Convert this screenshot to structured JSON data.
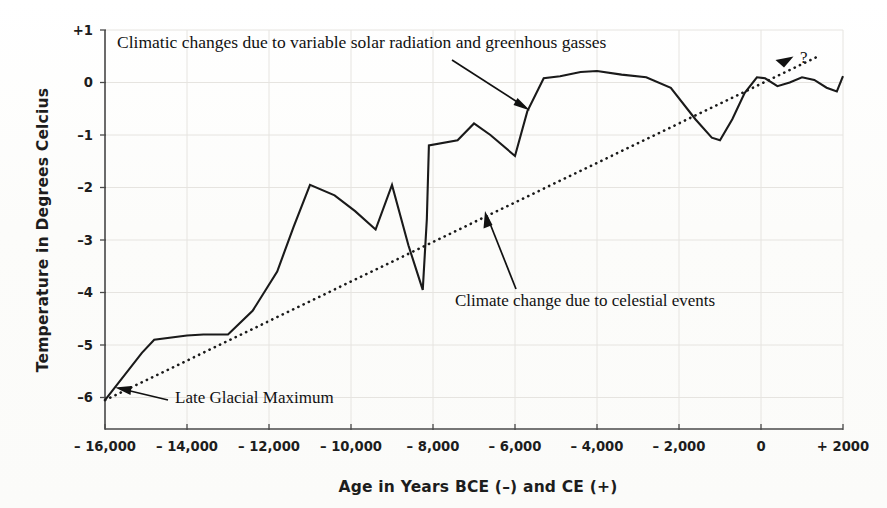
{
  "figure": {
    "background_color": "#fdfdfd",
    "ink_color": "#1a1a1a"
  },
  "chart_data": {
    "type": "line",
    "title": "",
    "xlabel": "Age in Years  BCE (–) and CE (+)",
    "ylabel": "Temperature in Degrees Celcius",
    "xlim": [
      -16000,
      2000
    ],
    "ylim": [
      -6.6,
      1.0
    ],
    "grid": true,
    "legend_position": "none",
    "xticks": [
      -16000,
      -14000,
      -12000,
      -10000,
      -8000,
      -6000,
      -4000,
      -2000,
      0,
      2000
    ],
    "xticklabels": [
      "– 16,000",
      "– 14,000",
      "– 12,000",
      "– 10,000",
      "– 8,000",
      "– 6,000",
      "– 4,000",
      "– 2,000",
      "0",
      "+ 2000"
    ],
    "yticks": [
      1,
      0,
      -1,
      -2,
      -3,
      -4,
      -5,
      -6
    ],
    "yticklabels": [
      "+1",
      "0",
      "–1",
      "–2",
      "–3",
      "–4",
      "–5",
      "–6"
    ],
    "series": [
      {
        "name": "Temperature reconstruction",
        "style": "solid",
        "x": [
          -16000,
          -15100,
          -14800,
          -14000,
          -13600,
          -13000,
          -12400,
          -11800,
          -11400,
          -11000,
          -10400,
          -9900,
          -9400,
          -9000,
          -8600,
          -8250,
          -8150,
          -8100,
          -7400,
          -7000,
          -6600,
          -6000,
          -5700,
          -5300,
          -4900,
          -4400,
          -4000,
          -3400,
          -2800,
          -2200,
          -1600,
          -1200,
          -1000,
          -700,
          -400,
          -100,
          100,
          400,
          700,
          1000,
          1300,
          1600,
          1850,
          2000
        ],
        "y": [
          -6.05,
          -5.15,
          -4.9,
          -4.82,
          -4.8,
          -4.8,
          -4.35,
          -3.6,
          -2.75,
          -1.95,
          -2.15,
          -2.45,
          -2.8,
          -1.95,
          -3.1,
          -3.95,
          -2.6,
          -1.2,
          -1.1,
          -0.78,
          -1.0,
          -1.4,
          -0.55,
          0.08,
          0.12,
          0.2,
          0.22,
          0.15,
          0.1,
          -0.1,
          -0.7,
          -1.05,
          -1.1,
          -0.7,
          -0.2,
          0.1,
          0.08,
          -0.07,
          0.0,
          0.1,
          0.05,
          -0.1,
          -0.17,
          0.12
        ]
      },
      {
        "name": "Celestial trend",
        "style": "dotted",
        "x": [
          -16000,
          1450
        ],
        "y": [
          -6.05,
          0.52
        ]
      }
    ],
    "annotations": [
      {
        "id": "solar-greenhouse",
        "text": "Climatic changes due to variable solar radiation and greenhous gasses",
        "arrow": true
      },
      {
        "id": "celestial-events",
        "text": "Climate change due to celestial events",
        "arrow": true
      },
      {
        "id": "late-glacial-maximum",
        "text": "Late Glacial Maximum",
        "arrow": true
      },
      {
        "id": "future-question",
        "text": "?",
        "arrow": false
      }
    ]
  }
}
